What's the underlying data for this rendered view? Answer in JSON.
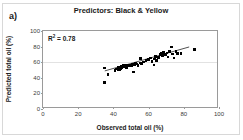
{
  "figure": {
    "panel_label": "a)"
  },
  "chart_data": {
    "type": "scatter",
    "title": "Predictors: Black & Yellow",
    "xlabel": "Observed total oil (%)",
    "ylabel": "Predicted total oil (%)",
    "xlim": [
      0,
      100
    ],
    "ylim": [
      0,
      100
    ],
    "xticks": [
      0,
      20,
      40,
      60,
      80,
      100
    ],
    "yticks": [
      0,
      20,
      40,
      60,
      80,
      100
    ],
    "grid": "horizontal-at-60",
    "legend": "none",
    "annotations": [
      {
        "text_prefix": "R",
        "text_sup": "2",
        "text_suffix": " = 0.78",
        "value": 0.78
      }
    ],
    "trendline": {
      "x": [
        35.5,
        84.0
      ],
      "y": [
        47.5,
        79.0
      ]
    },
    "points": [
      {
        "x": 34.8,
        "y": 52.5
      },
      {
        "x": 34.8,
        "y": 34.0
      },
      {
        "x": 37.0,
        "y": 44.0
      },
      {
        "x": 41.0,
        "y": 49.0
      },
      {
        "x": 41.8,
        "y": 51.5
      },
      {
        "x": 42.5,
        "y": 50.5
      },
      {
        "x": 43.0,
        "y": 53.5
      },
      {
        "x": 43.5,
        "y": 51.0
      },
      {
        "x": 44.0,
        "y": 52.0
      },
      {
        "x": 44.5,
        "y": 54.5
      },
      {
        "x": 45.0,
        "y": 52.5
      },
      {
        "x": 45.5,
        "y": 55.5
      },
      {
        "x": 46.0,
        "y": 54.0
      },
      {
        "x": 46.5,
        "y": 56.5
      },
      {
        "x": 47.5,
        "y": 53.0
      },
      {
        "x": 48.0,
        "y": 56.0
      },
      {
        "x": 49.5,
        "y": 55.5
      },
      {
        "x": 50.5,
        "y": 55.0
      },
      {
        "x": 51.0,
        "y": 57.0
      },
      {
        "x": 51.5,
        "y": 47.5
      },
      {
        "x": 52.0,
        "y": 56.5
      },
      {
        "x": 52.5,
        "y": 58.5
      },
      {
        "x": 53.0,
        "y": 57.5
      },
      {
        "x": 54.0,
        "y": 56.0
      },
      {
        "x": 55.0,
        "y": 59.0
      },
      {
        "x": 55.5,
        "y": 65.0
      },
      {
        "x": 56.0,
        "y": 58.0
      },
      {
        "x": 57.0,
        "y": 60.5
      },
      {
        "x": 58.5,
        "y": 62.0
      },
      {
        "x": 60.0,
        "y": 63.5
      },
      {
        "x": 61.0,
        "y": 65.5
      },
      {
        "x": 62.0,
        "y": 61.0
      },
      {
        "x": 63.0,
        "y": 56.5
      },
      {
        "x": 63.5,
        "y": 64.0
      },
      {
        "x": 64.0,
        "y": 67.5
      },
      {
        "x": 64.5,
        "y": 62.5
      },
      {
        "x": 65.5,
        "y": 66.0
      },
      {
        "x": 66.5,
        "y": 69.5
      },
      {
        "x": 67.0,
        "y": 71.0
      },
      {
        "x": 68.0,
        "y": 68.5
      },
      {
        "x": 68.5,
        "y": 72.5
      },
      {
        "x": 69.5,
        "y": 70.0
      },
      {
        "x": 70.5,
        "y": 72.0
      },
      {
        "x": 71.0,
        "y": 66.5
      },
      {
        "x": 72.0,
        "y": 74.0
      },
      {
        "x": 73.0,
        "y": 79.5
      },
      {
        "x": 73.5,
        "y": 70.5
      },
      {
        "x": 74.5,
        "y": 65.5
      },
      {
        "x": 75.5,
        "y": 73.5
      },
      {
        "x": 76.5,
        "y": 71.5
      },
      {
        "x": 78.5,
        "y": 71.0
      },
      {
        "x": 86.0,
        "y": 76.5
      }
    ]
  }
}
